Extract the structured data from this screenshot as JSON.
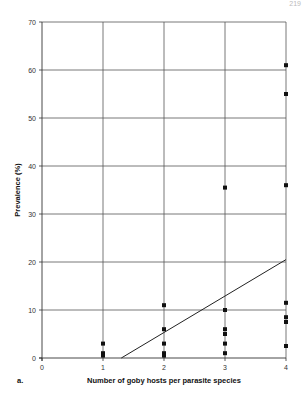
{
  "figure": {
    "panel_label": "a.",
    "page_number": "219"
  },
  "chart_data": {
    "type": "scatter",
    "title": "",
    "xlabel": "Number of goby hosts per parasite species",
    "ylabel": "Prevalence (%)",
    "xlim": [
      0,
      4
    ],
    "ylim": [
      0,
      70
    ],
    "x_ticks": [
      0,
      1,
      2,
      3,
      4
    ],
    "y_ticks": [
      0,
      10,
      20,
      30,
      40,
      50,
      60,
      70
    ],
    "grid": true,
    "legend": null,
    "series": [
      {
        "name": "Parasite species",
        "marker": "square",
        "points": [
          {
            "x": 1,
            "y": 3
          },
          {
            "x": 1,
            "y": 1
          },
          {
            "x": 1,
            "y": 0.5
          },
          {
            "x": 2,
            "y": 11
          },
          {
            "x": 2,
            "y": 6
          },
          {
            "x": 2,
            "y": 3
          },
          {
            "x": 2,
            "y": 1
          },
          {
            "x": 2,
            "y": 0.5
          },
          {
            "x": 3,
            "y": 35.5
          },
          {
            "x": 3,
            "y": 10
          },
          {
            "x": 3,
            "y": 6
          },
          {
            "x": 3,
            "y": 5
          },
          {
            "x": 3,
            "y": 3
          },
          {
            "x": 3,
            "y": 1
          },
          {
            "x": 4,
            "y": 61
          },
          {
            "x": 4,
            "y": 55
          },
          {
            "x": 4,
            "y": 36
          },
          {
            "x": 4,
            "y": 11.5
          },
          {
            "x": 4,
            "y": 8.5
          },
          {
            "x": 4,
            "y": 7.5
          },
          {
            "x": 4,
            "y": 2.5
          }
        ]
      }
    ],
    "trendline": {
      "type": "linear",
      "x": [
        1.3,
        4
      ],
      "y": [
        0,
        20.5
      ]
    }
  }
}
